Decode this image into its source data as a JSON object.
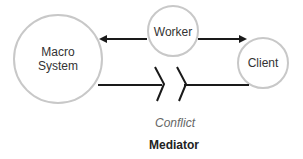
{
  "diagram": {
    "nodes": {
      "macro_system": {
        "label_line1": "Macro",
        "label_line2": "System",
        "cx": 58,
        "cy": 59,
        "r": 44
      },
      "worker": {
        "label": "Worker",
        "cx": 173,
        "cy": 31,
        "r": 25
      },
      "client": {
        "label": "Client",
        "cx": 263,
        "cy": 63,
        "r": 25
      }
    },
    "edges": [
      {
        "from": "worker",
        "to": "macro_system",
        "type": "arrow"
      },
      {
        "from": "worker",
        "to": "client",
        "type": "arrow"
      },
      {
        "from": "macro_system",
        "to": "client",
        "type": "broken-line"
      }
    ],
    "conflict_label": "Conflict",
    "mediator_label": "Mediator",
    "colors": {
      "circle_stroke": "#c8c8c8",
      "line": "#1a1a1a",
      "conflict_text": "#666666",
      "mediator_text": "#222222"
    }
  }
}
